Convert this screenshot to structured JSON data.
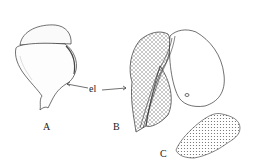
{
  "figure": {
    "labels": {
      "a": "A",
      "b": "B",
      "c": "C",
      "el": "el"
    },
    "colors": {
      "ink": "#333333",
      "fill": "#ffffff",
      "hatch": "#777777"
    }
  }
}
